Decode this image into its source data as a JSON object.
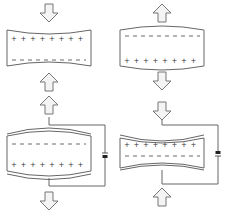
{
  "diagram": {
    "colors": {
      "stroke": "#555555",
      "arrow_fill": "#f2f2f2",
      "arrow_stroke": "#777777",
      "battery": "#222222"
    },
    "panels": [
      {
        "id": "top-left",
        "label": "compressed crystal",
        "arrows": "pointing inward (compression)",
        "top_charge": "+ + + + + + + +",
        "bottom_charge": "- - - - - - - -",
        "shape": "concave (pinched)"
      },
      {
        "id": "top-right",
        "label": "stretched crystal",
        "arrows": "pointing outward (tension)",
        "top_charge": "- - - - - - - -",
        "bottom_charge": "+ + + + + + + +",
        "shape": "convex (bulged)"
      },
      {
        "id": "bottom-left",
        "label": "crystal with applied voltage - expansion",
        "arrows": "pointing outward",
        "top_charge": "- - - - - - - -",
        "bottom_charge": "+ + + + + + + +",
        "shape": "convex with electrodes",
        "battery": true
      },
      {
        "id": "bottom-right",
        "label": "crystal with reversed voltage - contraction",
        "arrows": "pointing inward",
        "top_charge": "+ + + + + + + +",
        "bottom_charge": "- - - - - - - -",
        "shape": "concave with electrodes",
        "battery": true
      }
    ]
  }
}
